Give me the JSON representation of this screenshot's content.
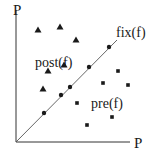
{
  "diagram": {
    "y_axis_label": "P",
    "x_axis_label": "P",
    "diagonal_label": "fix(f)",
    "upper_region_label": "post(f)",
    "lower_region_label": "pre(f)",
    "colors": {
      "ink": "#1a1a1a",
      "line": "#555555",
      "background": "#ffffff"
    },
    "markers": {
      "post_triangles": [
        [
          38,
          30
        ],
        [
          60,
          27
        ],
        [
          76,
          40
        ],
        [
          48,
          71
        ],
        [
          64,
          65
        ],
        [
          43,
          89
        ]
      ],
      "fix_dots": [
        [
          109,
          47
        ],
        [
          89,
          67
        ],
        [
          70,
          87
        ],
        [
          61,
          95
        ],
        [
          44,
          113
        ]
      ],
      "pre_squares": [
        [
          118,
          71
        ],
        [
          103,
          83
        ],
        [
          128,
          85
        ],
        [
          77,
          103
        ],
        [
          112,
          117
        ],
        [
          87,
          125
        ]
      ]
    }
  }
}
